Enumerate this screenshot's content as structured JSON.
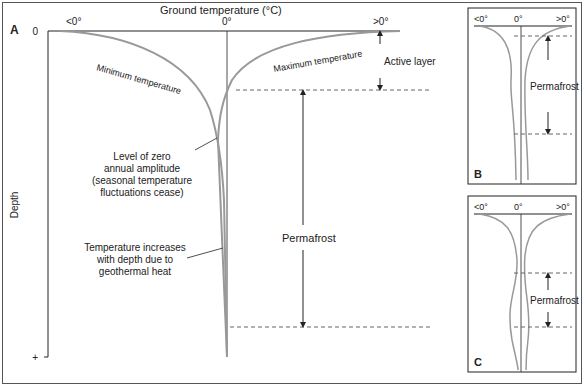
{
  "panel_a": {
    "label": "A",
    "x_title": "Ground temperature (°C)",
    "x_ticks": [
      "<0°",
      "0°",
      ">0°"
    ],
    "y_title": "Depth",
    "y_ticks": [
      "0",
      "+"
    ],
    "curve_min_label": "Minimum temperature",
    "curve_max_label": "Maximum temperature",
    "active_layer_label": "Active layer",
    "permafrost_label": "Permafrost",
    "zero_amp_label": [
      "Level of zero",
      "annual amplitude",
      "(seasonal temperature",
      "fluctuations cease)"
    ],
    "geothermal_label": [
      "Temperature increases",
      "with depth due to",
      "geothermal heat"
    ]
  },
  "panel_b": {
    "label": "B",
    "x_ticks": [
      "<0°",
      "0°",
      ">0°"
    ],
    "permafrost_label": "Permafrost"
  },
  "panel_c": {
    "label": "C",
    "x_ticks": [
      "<0°",
      "0°",
      ">0°"
    ],
    "permafrost_label": "Permafrost"
  },
  "colors": {
    "curve": "#999999",
    "line": "#222222",
    "dash": "#666666"
  }
}
